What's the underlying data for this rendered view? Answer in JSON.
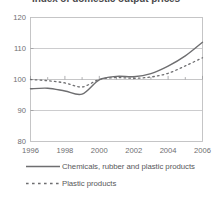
{
  "chart_data": {
    "type": "line",
    "title": "Index of domestic output prices",
    "xlabel": "",
    "ylabel": "",
    "xlim": [
      1996,
      2006
    ],
    "ylim": [
      80,
      120
    ],
    "yticks": [
      80,
      90,
      100,
      110,
      120
    ],
    "xticks": [
      1996,
      1998,
      2000,
      2002,
      2004,
      2006
    ],
    "xtick_labels": [
      "1996",
      "1998",
      "2000",
      "2002",
      "2004",
      "2006"
    ],
    "ytick_labels": [
      "80",
      "90",
      "100",
      "110",
      "120"
    ],
    "grid": true,
    "grid_axis": "y",
    "legend_position": "below",
    "x": [
      1996,
      1997,
      1998,
      1999,
      2000,
      2001,
      2002,
      2003,
      2004,
      2005,
      2006
    ],
    "series": [
      {
        "name": "Chemicals, rubber and plastic products",
        "style": "solid",
        "color": "#6e6e70",
        "values": [
          97.0,
          97.2,
          96.3,
          95.3,
          99.9,
          101.0,
          100.9,
          101.9,
          104.3,
          107.6,
          112.0
        ]
      },
      {
        "name": "Plastic products",
        "style": "dashed",
        "color": "#6e6e70",
        "values": [
          100.0,
          99.6,
          98.9,
          97.6,
          100.0,
          100.6,
          100.4,
          100.8,
          102.0,
          104.4,
          107.0
        ]
      }
    ]
  },
  "legend": {
    "items": [
      {
        "label": "Chemicals, rubber and plastic products",
        "style": "solid"
      },
      {
        "label": "Plastic products",
        "style": "dashed"
      }
    ]
  }
}
